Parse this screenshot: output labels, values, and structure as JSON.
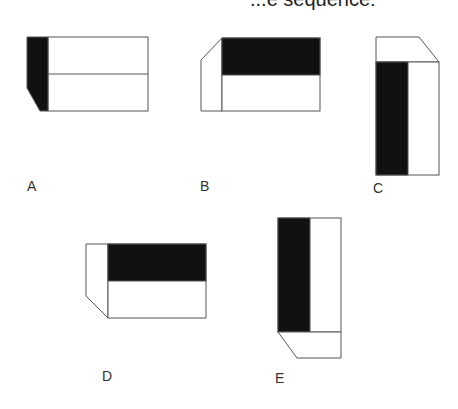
{
  "header": {
    "title_fragment": "...e sequence:"
  },
  "options": [
    {
      "id": "A",
      "label": "A"
    },
    {
      "id": "B",
      "label": "B"
    },
    {
      "id": "C",
      "label": "C"
    },
    {
      "id": "D",
      "label": "D"
    },
    {
      "id": "E",
      "label": "E"
    }
  ],
  "colors": {
    "fill": "#111111",
    "stroke": "#555555",
    "background": "#ffffff"
  }
}
